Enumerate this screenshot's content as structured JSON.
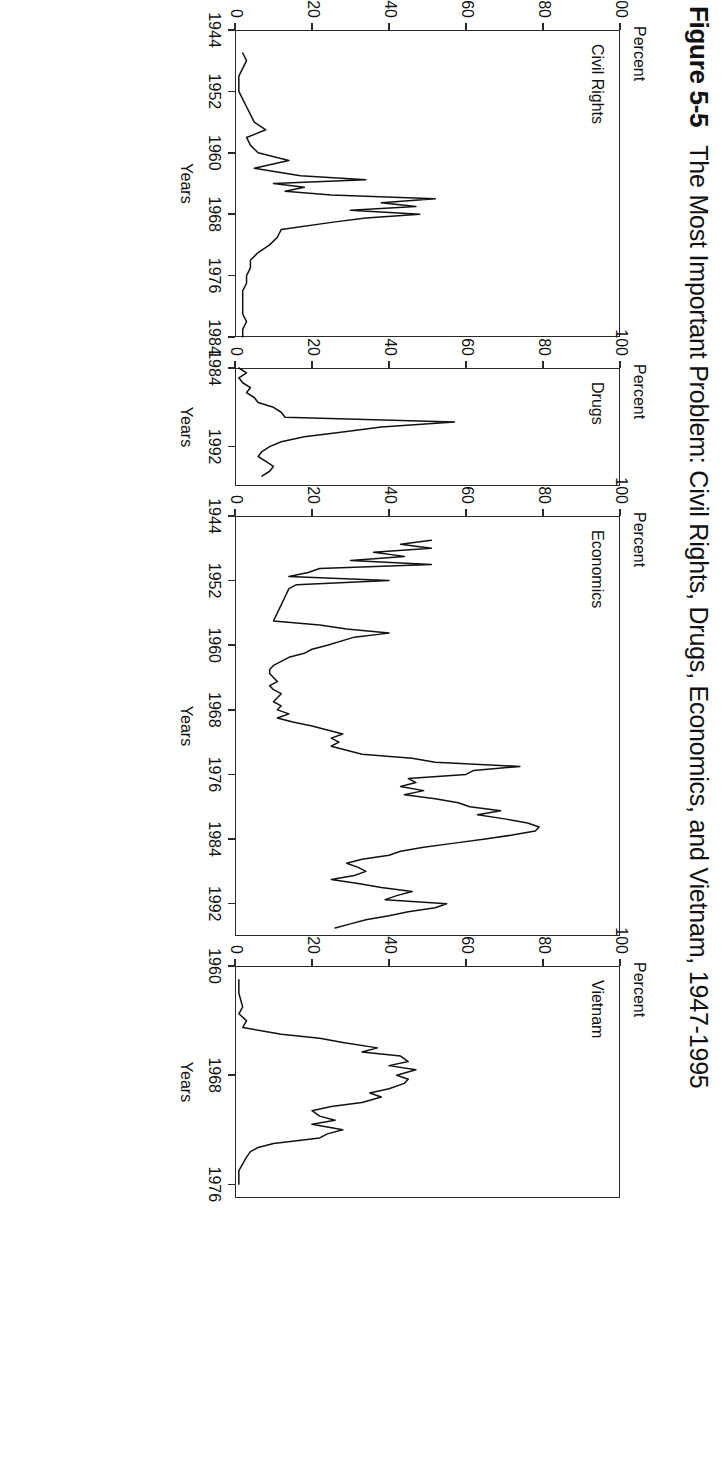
{
  "figure": {
    "number": "Figure 5-5",
    "title": "The Most Important Problem: Civil Rights, Drugs, Economics, and Vietnam, 1947-1995"
  },
  "axis_titles": {
    "y": "Percent",
    "x": "Years"
  },
  "chart_data": [
    {
      "type": "line",
      "title": "Civil Rights",
      "xlabel": "Years",
      "ylabel": "Percent",
      "ylim": [
        0,
        100
      ],
      "xlim": [
        1944,
        1984
      ],
      "yticks": [
        0,
        20,
        40,
        60,
        80,
        100
      ],
      "xticks": [
        1944,
        1952,
        1960,
        1968,
        1976,
        1984
      ],
      "grid": false,
      "legend": "none",
      "x": [
        1947,
        1948,
        1949,
        1950,
        1951,
        1952,
        1953,
        1954,
        1955,
        1956,
        1957,
        1958,
        1959,
        1960,
        1961,
        1962,
        1963,
        1963.5,
        1964,
        1964.5,
        1965,
        1965.5,
        1966,
        1966.5,
        1967,
        1967.5,
        1968,
        1968.5,
        1969,
        1970,
        1971,
        1972,
        1973,
        1974,
        1975,
        1976,
        1977,
        1978,
        1979,
        1980,
        1981,
        1982,
        1983,
        1984
      ],
      "values": [
        2,
        3,
        2,
        1,
        1,
        1,
        2,
        3,
        4,
        5,
        8,
        3,
        4,
        6,
        14,
        5,
        17,
        34,
        10,
        18,
        13,
        25,
        52,
        38,
        47,
        30,
        48,
        34,
        26,
        12,
        11,
        9,
        6,
        4,
        4,
        3,
        3,
        2,
        2,
        2,
        2,
        3,
        2,
        2
      ]
    },
    {
      "type": "line",
      "title": "Drugs",
      "xlabel": "Years",
      "ylabel": "Percent",
      "ylim": [
        0,
        100
      ],
      "xlim": [
        1984,
        1996
      ],
      "yticks": [
        0,
        20,
        40,
        60,
        80,
        100
      ],
      "xticks": [
        1984,
        1992
      ],
      "grid": false,
      "legend": "none",
      "x": [
        1984,
        1984.5,
        1985,
        1985.5,
        1986,
        1986.5,
        1987,
        1987.5,
        1988,
        1988.5,
        1989,
        1989.5,
        1990,
        1990.5,
        1991,
        1991.5,
        1992,
        1992.5,
        1993,
        1993.5,
        1994,
        1994.5,
        1995
      ],
      "values": [
        1,
        3,
        1,
        2,
        4,
        3,
        5,
        6,
        10,
        12,
        13,
        57,
        38,
        28,
        18,
        12,
        9,
        7,
        6,
        8,
        10,
        9,
        7
      ]
    },
    {
      "type": "line",
      "title": "Economics",
      "xlabel": "Years",
      "ylabel": "Percent",
      "ylim": [
        0,
        100
      ],
      "xlim": [
        1944,
        1996
      ],
      "yticks": [
        0,
        20,
        40,
        60,
        80,
        100
      ],
      "xticks": [
        1944,
        1952,
        1960,
        1968,
        1976,
        1984,
        1992
      ],
      "grid": false,
      "legend": "none",
      "x": [
        1947,
        1947.5,
        1948,
        1948.5,
        1949,
        1949.5,
        1950,
        1950.5,
        1951,
        1951.5,
        1952,
        1952.5,
        1953,
        1954,
        1955,
        1956,
        1957,
        1957.5,
        1958,
        1958.5,
        1959,
        1960,
        1960.5,
        1961,
        1961.5,
        1962,
        1962.5,
        1963,
        1963.5,
        1964,
        1964.5,
        1965,
        1965.5,
        1966,
        1966.5,
        1967,
        1967.5,
        1968,
        1968.5,
        1969,
        1969.5,
        1970,
        1970.5,
        1971,
        1971.5,
        1972,
        1972.5,
        1973,
        1973.5,
        1974,
        1974.5,
        1975,
        1975.5,
        1976,
        1976.5,
        1977,
        1977.5,
        1978,
        1978.5,
        1979,
        1979.5,
        1980,
        1980.5,
        1981,
        1981.5,
        1982,
        1982.5,
        1983,
        1983.5,
        1984,
        1984.5,
        1985,
        1985.5,
        1986,
        1986.5,
        1987,
        1987.5,
        1988,
        1988.5,
        1989,
        1989.5,
        1990,
        1990.5,
        1991,
        1991.5,
        1992,
        1992.5,
        1993,
        1993.5,
        1994,
        1994.5,
        1995
      ],
      "values": [
        51,
        43,
        51,
        36,
        44,
        30,
        51,
        22,
        19,
        14,
        40,
        16,
        14,
        13,
        12,
        11,
        10,
        22,
        29,
        40,
        31,
        24,
        20,
        18,
        14,
        12,
        10,
        9,
        9,
        10,
        11,
        9,
        10,
        12,
        11,
        10,
        12,
        11,
        14,
        11,
        15,
        20,
        24,
        28,
        25,
        27,
        25,
        29,
        33,
        46,
        52,
        74,
        62,
        60,
        45,
        47,
        43,
        49,
        44,
        52,
        58,
        61,
        69,
        63,
        70,
        76,
        79,
        78,
        72,
        65,
        57,
        49,
        43,
        40,
        33,
        29,
        32,
        34,
        31,
        25,
        32,
        38,
        46,
        42,
        39,
        55,
        52,
        45,
        40,
        34,
        30,
        26,
        24
      ]
    },
    {
      "type": "line",
      "title": "Vietnam",
      "xlabel": "Years",
      "ylabel": "Percent",
      "ylim": [
        0,
        100
      ],
      "xlim": [
        1960,
        1977
      ],
      "yticks": [
        0,
        20,
        40,
        60,
        80,
        100
      ],
      "xticks": [
        1960,
        1968,
        1976
      ],
      "grid": false,
      "legend": "none",
      "x": [
        1961,
        1962,
        1963,
        1963.5,
        1964,
        1964.5,
        1965,
        1965.3,
        1965.6,
        1966,
        1966.3,
        1966.6,
        1967,
        1967.3,
        1967.6,
        1968,
        1968.3,
        1968.6,
        1969,
        1969.3,
        1969.6,
        1970,
        1970.3,
        1970.6,
        1971,
        1971.3,
        1971.6,
        1972,
        1972.3,
        1972.6,
        1973,
        1973.3,
        1973.6,
        1974,
        1974.5,
        1975,
        1975.5,
        1976
      ],
      "values": [
        1,
        1,
        2,
        1,
        3,
        2,
        12,
        22,
        28,
        37,
        33,
        43,
        45,
        40,
        47,
        42,
        45,
        44,
        40,
        35,
        38,
        33,
        25,
        20,
        22,
        26,
        20,
        28,
        24,
        22,
        10,
        6,
        4,
        3,
        2,
        1,
        1,
        1
      ]
    }
  ]
}
